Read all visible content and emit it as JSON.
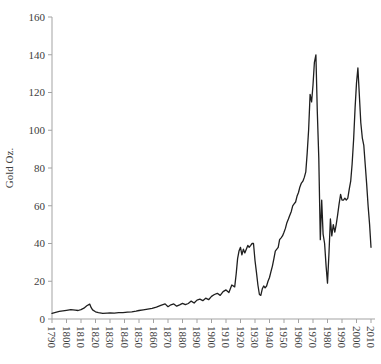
{
  "chart_data": {
    "type": "line",
    "title": "",
    "xlabel": "",
    "ylabel": "Gold Oz.",
    "grid": false,
    "legend": "none",
    "ylim": [
      0,
      160
    ],
    "y_ticks": [
      0,
      20,
      40,
      60,
      80,
      100,
      120,
      140,
      160
    ],
    "x_tick_labels": [
      "1790",
      "1800",
      "1810",
      "1820",
      "1830",
      "1840",
      "1850",
      "1860",
      "1870",
      "1880",
      "1890",
      "1900",
      "1910",
      "1920",
      "1930",
      "1940",
      "1950",
      "1960",
      "1970",
      "1980",
      "1990",
      "2000",
      "2010"
    ],
    "xlim": [
      1790,
      2012
    ],
    "series": [
      {
        "name": "Gold Oz.",
        "x": [
          1790,
          1795,
          1800,
          1803,
          1806,
          1808,
          1810,
          1812,
          1814,
          1816,
          1817,
          1818,
          1820,
          1822,
          1825,
          1828,
          1830,
          1833,
          1836,
          1839,
          1842,
          1845,
          1848,
          1850,
          1853,
          1856,
          1859,
          1862,
          1865,
          1868,
          1870,
          1872,
          1874,
          1876,
          1878,
          1880,
          1882,
          1884,
          1886,
          1888,
          1890,
          1892,
          1894,
          1896,
          1898,
          1900,
          1902,
          1904,
          1906,
          1908,
          1910,
          1912,
          1914,
          1916,
          1917,
          1918,
          1919,
          1920,
          1921,
          1922,
          1923,
          1924,
          1925,
          1926,
          1927,
          1928,
          1929,
          1930,
          1931,
          1932,
          1933,
          1934,
          1935,
          1936,
          1937,
          1938,
          1939,
          1940,
          1941,
          1942,
          1943,
          1944,
          1945,
          1946,
          1947,
          1948,
          1949,
          1950,
          1951,
          1952,
          1953,
          1954,
          1955,
          1956,
          1957,
          1958,
          1959,
          1960,
          1961,
          1962,
          1963,
          1964,
          1965,
          1966,
          1967,
          1968,
          1969,
          1970,
          1971,
          1972,
          1973,
          1974,
          1975,
          1976,
          1977,
          1978,
          1979,
          1980,
          1981,
          1982,
          1983,
          1984,
          1985,
          1986,
          1987,
          1988,
          1989,
          1990,
          1991,
          1992,
          1993,
          1994,
          1995,
          1996,
          1997,
          1998,
          1999,
          2000,
          2001,
          2002,
          2003,
          2004,
          2005,
          2006,
          2007,
          2008,
          2009,
          2010
        ],
        "y": [
          3.0,
          4.0,
          4.6,
          5.0,
          4.7,
          4.5,
          5.0,
          5.7,
          7.0,
          7.9,
          6.0,
          4.8,
          3.8,
          3.4,
          3.0,
          3.1,
          3.2,
          3.1,
          3.4,
          3.4,
          3.6,
          3.8,
          4.2,
          4.5,
          4.8,
          5.2,
          5.6,
          6.3,
          7.2,
          8.0,
          6.5,
          7.5,
          8.0,
          6.8,
          7.5,
          8.3,
          7.6,
          8.2,
          9.5,
          8.5,
          10.0,
          10.5,
          9.7,
          11.0,
          10.2,
          12.0,
          13.0,
          13.6,
          12.5,
          14.5,
          15.4,
          14.0,
          18.0,
          17.0,
          24.0,
          32.0,
          36.0,
          38.0,
          34.0,
          37.0,
          35.0,
          37.0,
          39.0,
          38.0,
          39.0,
          40.0,
          40.0,
          31.0,
          25.0,
          18.0,
          13.0,
          12.5,
          16.0,
          17.5,
          16.5,
          17.5,
          20.0,
          22.0,
          25.0,
          28.0,
          32.0,
          36.0,
          37.0,
          38.0,
          42.0,
          43.0,
          44.0,
          46.0,
          48.0,
          51.0,
          53.0,
          55.0,
          57.0,
          60.0,
          61.0,
          62.0,
          65.0,
          67.0,
          70.0,
          72.0,
          73.0,
          75.0,
          78.0,
          88.0,
          100.0,
          119.0,
          115.0,
          124.0,
          136.0,
          140.0,
          110.0,
          85.0,
          42.0,
          63.0,
          45.0,
          40.0,
          28.0,
          19.0,
          34.0,
          53.0,
          44.0,
          50.0,
          46.0,
          50.0,
          55.0,
          61.0,
          66.0,
          63.0,
          63.0,
          64.0,
          63.0,
          64.0,
          69.0,
          73.0,
          82.0,
          95.0,
          112.0,
          125.0,
          133.0,
          118.0,
          104.0,
          96.0,
          92.0,
          82.0,
          72.0,
          60.0,
          50.0,
          38.0
        ]
      }
    ],
    "colors": {
      "line": "#1f1f1f",
      "axis": "#a3a3a3",
      "tick_text": "#404040",
      "background": "#ffffff"
    },
    "layout": {
      "plot_left": 52,
      "plot_right_end": 375,
      "plot_top": 17,
      "plot_bottom": 319,
      "px_per_year": 1.45,
      "base_year": 1790,
      "tick_len": 4,
      "font_size": 11
    }
  }
}
